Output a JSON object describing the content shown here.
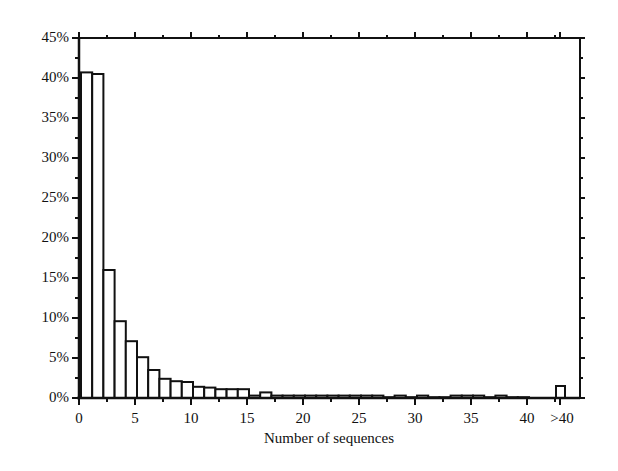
{
  "chart_data": {
    "type": "bar",
    "title": "",
    "xlabel": "Number of sequences",
    "ylabel": "",
    "ylim": [
      0,
      45
    ],
    "y_ticks": [
      "0%",
      "5%",
      "10%",
      "15%",
      "20%",
      "25%",
      "30%",
      "35%",
      "40%",
      "45%"
    ],
    "x_ticks": [
      "0",
      "5",
      "10",
      "15",
      "20",
      "25",
      "30",
      "35",
      "40",
      ">40"
    ],
    "grid": false,
    "legend": null,
    "categories": [
      "1",
      "2",
      "3",
      "4",
      "5",
      "6",
      "7",
      "8",
      "9",
      "10",
      "11",
      "12",
      "13",
      "14",
      "15",
      "16",
      "17",
      "18",
      "19",
      "20",
      "21",
      "22",
      "23",
      "24",
      "25",
      "26",
      "27",
      "28",
      "29",
      "30",
      "31",
      "32",
      "33",
      "34",
      "35",
      "36",
      "37",
      "38",
      "39",
      "40",
      ">40"
    ],
    "values": [
      40.7,
      40.5,
      16.0,
      9.6,
      7.1,
      5.1,
      3.5,
      2.4,
      2.1,
      2.0,
      1.4,
      1.3,
      1.1,
      1.1,
      1.1,
      0.3,
      0.7,
      0.3,
      0.3,
      0.3,
      0.3,
      0.3,
      0.3,
      0.3,
      0.3,
      0.3,
      0.3,
      0.1,
      0.3,
      0.1,
      0.3,
      0.1,
      0.1,
      0.3,
      0.3,
      0.3,
      0.1,
      0.3,
      0.1,
      0.1,
      1.5
    ],
    "value_unit": "%"
  }
}
